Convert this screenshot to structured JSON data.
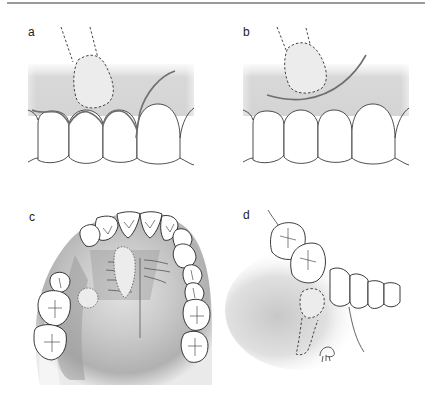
{
  "figure": {
    "panels": [
      {
        "id": "a",
        "label": "a",
        "depiction": "labial view of anterior teeth with impacted canine outline and marginal/vertical incision"
      },
      {
        "id": "b",
        "label": "b",
        "depiction": "labial view of anterior teeth with impacted canine outline and semilunar incision"
      },
      {
        "id": "c",
        "label": "c",
        "depiction": "occlusal view of maxillary arch with palatal impacted canine and incision lines"
      },
      {
        "id": "d",
        "label": "d",
        "depiction": "lateral view of mandibular teeth with impacted tooth outline and incision"
      }
    ]
  },
  "colors": {
    "rule": "#9a9a9a",
    "gingiva_band": "#d6d6d6",
    "incision": "#777777",
    "outline": "#222222",
    "palate_shade": "#9e9e9e"
  }
}
